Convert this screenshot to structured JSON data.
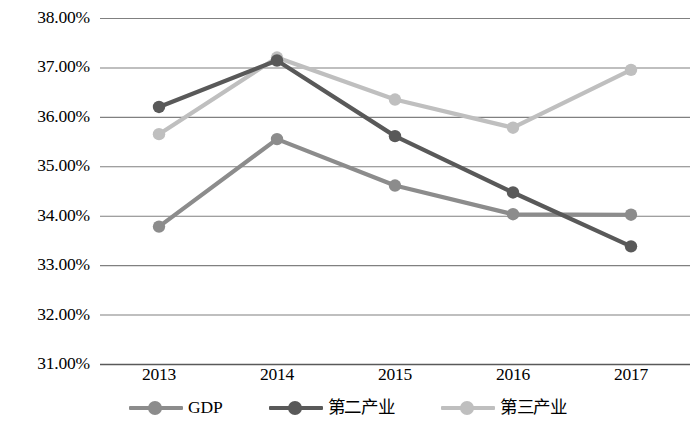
{
  "chart_data": {
    "type": "line",
    "title": "",
    "xlabel": "",
    "ylabel": "",
    "categories": [
      "2013",
      "2014",
      "2015",
      "2016",
      "2017"
    ],
    "ylim": [
      31.0,
      38.0
    ],
    "ytick_labels": [
      "38.00%",
      "37.00%",
      "36.00%",
      "35.00%",
      "34.00%",
      "33.00%",
      "32.00%",
      "31.00%"
    ],
    "ytick_values": [
      38.0,
      37.0,
      36.0,
      35.0,
      34.0,
      33.0,
      32.0,
      31.0
    ],
    "grid": "horizontal",
    "legend_position": "bottom",
    "series": [
      {
        "name": "GDP",
        "color": "#8c8c8c",
        "values": [
          33.78,
          35.55,
          34.61,
          34.03,
          34.02
        ]
      },
      {
        "name": "第二产业",
        "color": "#595959",
        "values": [
          36.2,
          37.14,
          35.61,
          34.47,
          33.38
        ]
      },
      {
        "name": "第三产业",
        "color": "#bfbfbf",
        "values": [
          35.65,
          37.2,
          36.35,
          35.78,
          36.95
        ]
      }
    ]
  },
  "legend": {
    "items": [
      {
        "label": "GDP",
        "color": "#8c8c8c"
      },
      {
        "label": "第二产业",
        "color": "#595959"
      },
      {
        "label": "第三产业",
        "color": "#bfbfbf"
      }
    ]
  },
  "axis": {
    "gridline_color": "#808080",
    "baseline_color": "#595959"
  }
}
